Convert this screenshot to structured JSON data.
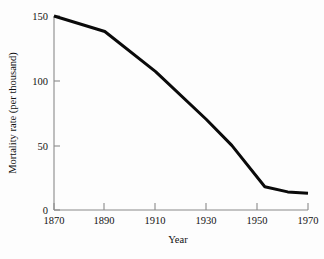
{
  "chart_data": {
    "type": "line",
    "title": "",
    "xlabel": "Year",
    "ylabel": "Mortality rate (per thousand)",
    "xlim": [
      1870,
      1970
    ],
    "ylim": [
      0,
      150
    ],
    "grid": false,
    "legend": null,
    "line_color": "#0a0a0a",
    "axis_color": "#8a8a8a",
    "background_color": "#fdfdfd",
    "xticks": [
      1870,
      1890,
      1910,
      1930,
      1950,
      1970
    ],
    "xtick_labels": [
      "1870",
      "1890",
      "1910",
      "1930",
      "1950",
      "1970"
    ],
    "yticks": [
      0,
      50,
      100,
      150
    ],
    "ytick_labels": [
      "0",
      "50",
      "100",
      "150"
    ],
    "series": [
      {
        "name": "Mortality rate",
        "x": [
          1870,
          1890,
          1910,
          1930,
          1940,
          1953,
          1962,
          1970
        ],
        "values": [
          150,
          138,
          107,
          70,
          50,
          18,
          14,
          13
        ]
      }
    ]
  },
  "labels": {
    "x_axis_title": "Year",
    "y_axis_title": "Mortality rate (per thousand)"
  }
}
